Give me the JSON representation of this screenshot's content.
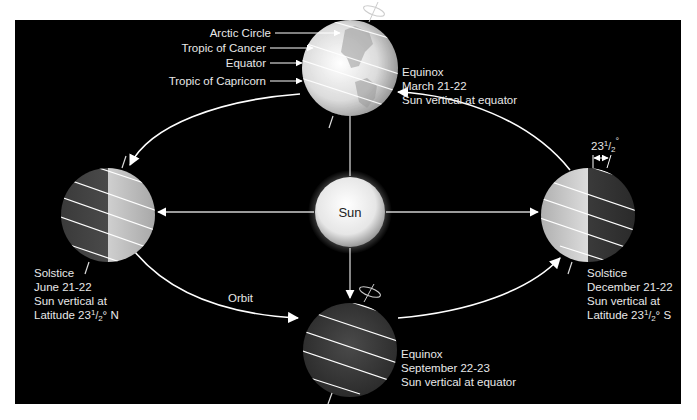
{
  "diagram": {
    "sun": {
      "label": "Sun"
    },
    "orbit": {
      "label": "Orbit"
    },
    "latitude_lines": {
      "arctic_circle": "Arctic Circle",
      "tropic_of_cancer": "Tropic of Cancer",
      "equator": "Equator",
      "tropic_of_capricorn": "Tropic of Capricorn"
    },
    "tilt": {
      "label_whole": "23",
      "label_num": "1",
      "label_den": "2",
      "label_deg": "°"
    },
    "positions": {
      "march": {
        "line1": "Equinox",
        "line2": "March 21-22",
        "line3": "Sun vertical at equator"
      },
      "june": {
        "line1": "Solstice",
        "line2": "June 21-22",
        "line3": "Sun vertical at",
        "line4_prefix": "Latitude 23",
        "line4_frac": "1/2",
        "line4_suffix": "° N"
      },
      "september": {
        "line1": "Equinox",
        "line2": "September 22-23",
        "line3": "Sun vertical at equator"
      },
      "december": {
        "line1": "Solstice",
        "line2": "December 21-22",
        "line3": "Sun vertical at",
        "line4_prefix": "Latitude 23",
        "line4_frac": "1/2",
        "line4_suffix": "° S"
      }
    },
    "colors": {
      "background": "#000000",
      "frame": "#ffffff",
      "line": "#ffffff",
      "text": "#e8e8e8"
    }
  }
}
